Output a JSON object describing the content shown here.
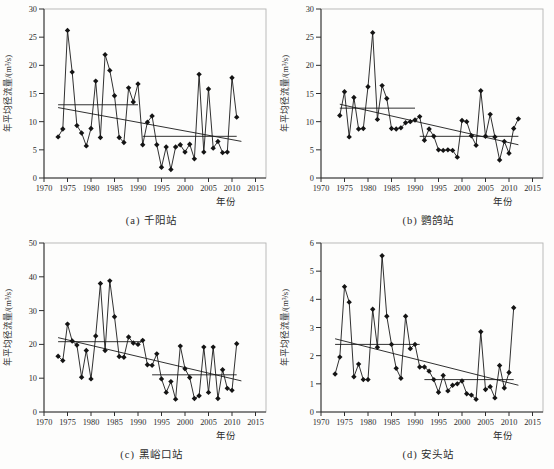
{
  "colors": {
    "line": "#1a1a1a",
    "marker": "#141414",
    "frame": "#b3b3b3",
    "axis": "#2e2e2e",
    "text": "#2b2b2b",
    "background": "#fdfdfc"
  },
  "axis_labels": {
    "y": "年平均径流量/(m³/s)",
    "x": "年份"
  },
  "chart_data": [
    {
      "id": "a",
      "type": "line",
      "station": "千阳站",
      "caption": "(a) 千阳站",
      "xlabel": "年份",
      "ylabel": "年平均径流量/(m³/s)",
      "xlim": [
        1970,
        2015
      ],
      "ylim": [
        0,
        30
      ],
      "xticks": [
        1970,
        1975,
        1980,
        1985,
        1990,
        1995,
        2000,
        2005,
        2010,
        2015
      ],
      "yticks": [
        0,
        5,
        10,
        15,
        20,
        25,
        30
      ],
      "years": [
        1973,
        1974,
        1975,
        1976,
        1977,
        1978,
        1979,
        1980,
        1981,
        1982,
        1983,
        1984,
        1985,
        1986,
        1987,
        1988,
        1989,
        1990,
        1991,
        1992,
        1993,
        1994,
        1995,
        1996,
        1997,
        1998,
        1999,
        2000,
        2001,
        2002,
        2003,
        2004,
        2005,
        2006,
        2007,
        2008,
        2009,
        2010,
        2011
      ],
      "values": [
        7.3,
        8.7,
        26.2,
        18.8,
        9.3,
        8.0,
        5.7,
        8.8,
        17.2,
        7.2,
        21.9,
        19.1,
        14.6,
        7.2,
        6.3,
        16.0,
        13.5,
        16.7,
        5.9,
        9.9,
        11.0,
        5.9,
        1.9,
        5.5,
        1.5,
        5.5,
        5.9,
        4.6,
        6.0,
        3.4,
        18.4,
        4.6,
        15.8,
        5.3,
        6.5,
        4.5,
        4.6,
        17.8,
        10.8
      ],
      "mean_lines": [
        {
          "from_year": 1973,
          "to_year": 1990,
          "value": 13.0
        },
        {
          "from_year": 1991,
          "to_year": 2011,
          "value": 7.4
        }
      ],
      "trend_line": {
        "from_year": 1973,
        "from_value": 12.5,
        "to_year": 2012,
        "to_value": 6.5
      }
    },
    {
      "id": "b",
      "type": "line",
      "station": "鹦鸽站",
      "caption": "(b) 鹦鸽站",
      "xlabel": "年份",
      "ylabel": "年平均径流量/(m³/s)",
      "xlim": [
        1970,
        2015
      ],
      "ylim": [
        0,
        30
      ],
      "xticks": [
        1970,
        1975,
        1980,
        1985,
        1990,
        1995,
        2000,
        2005,
        2010,
        2015
      ],
      "yticks": [
        0,
        5,
        10,
        15,
        20,
        25,
        30
      ],
      "years": [
        1974,
        1975,
        1976,
        1977,
        1978,
        1979,
        1980,
        1981,
        1982,
        1983,
        1984,
        1985,
        1986,
        1987,
        1988,
        1989,
        1990,
        1991,
        1992,
        1993,
        1994,
        1995,
        1996,
        1997,
        1998,
        1999,
        2000,
        2001,
        2002,
        2003,
        2004,
        2005,
        2006,
        2007,
        2008,
        2009,
        2010,
        2011,
        2012
      ],
      "values": [
        11.1,
        15.3,
        7.3,
        14.3,
        8.7,
        8.8,
        16.2,
        25.8,
        10.4,
        16.4,
        14.1,
        8.8,
        8.7,
        8.9,
        9.8,
        10.0,
        10.3,
        10.9,
        6.7,
        8.7,
        7.4,
        5.0,
        4.9,
        5.0,
        4.9,
        3.7,
        10.2,
        10.0,
        7.5,
        5.8,
        15.5,
        7.4,
        11.3,
        7.3,
        3.2,
        6.5,
        4.4,
        8.8,
        10.5
      ],
      "mean_lines": [
        {
          "from_year": 1974,
          "to_year": 1990,
          "value": 12.4
        },
        {
          "from_year": 1991,
          "to_year": 2012,
          "value": 7.4
        }
      ],
      "trend_line": {
        "from_year": 1974,
        "from_value": 13.1,
        "to_year": 2012,
        "to_value": 5.9
      }
    },
    {
      "id": "c",
      "type": "line",
      "station": "黑峪口站",
      "caption": "(c) 黑峪口站",
      "xlabel": "年份",
      "ylabel": "年平均径流量/(m³/s)",
      "xlim": [
        1970,
        2015
      ],
      "ylim": [
        0,
        50
      ],
      "xticks": [
        1970,
        1975,
        1980,
        1985,
        1990,
        1995,
        2000,
        2005,
        2010,
        2015
      ],
      "yticks": [
        0,
        10,
        20,
        30,
        40,
        50
      ],
      "years": [
        1973,
        1974,
        1975,
        1976,
        1977,
        1978,
        1979,
        1980,
        1981,
        1982,
        1983,
        1984,
        1985,
        1986,
        1987,
        1988,
        1989,
        1990,
        1991,
        1992,
        1993,
        1994,
        1995,
        1996,
        1997,
        1998,
        1999,
        2000,
        2001,
        2002,
        2003,
        2004,
        2005,
        2006,
        2007,
        2008,
        2009,
        2010,
        2011
      ],
      "values": [
        16.5,
        15.2,
        26.0,
        21.0,
        19.8,
        10.3,
        18.2,
        9.8,
        22.5,
        38.0,
        18.2,
        38.8,
        28.2,
        16.4,
        16.2,
        22.2,
        20.4,
        20.0,
        21.2,
        14.0,
        13.8,
        17.2,
        9.8,
        5.8,
        9.0,
        3.8,
        19.5,
        12.8,
        10.2,
        4.0,
        4.8,
        19.2,
        5.8,
        19.2,
        4.0,
        12.5,
        7.0,
        6.4,
        20.2
      ],
      "mean_lines": [
        {
          "from_year": 1973,
          "to_year": 1991,
          "value": 20.8
        },
        {
          "from_year": 1993,
          "to_year": 2011,
          "value": 11.0
        }
      ],
      "trend_line": {
        "from_year": 1973,
        "from_value": 22.0,
        "to_year": 2012,
        "to_value": 9.2
      }
    },
    {
      "id": "d",
      "type": "line",
      "station": "安头站",
      "caption": "(d) 安头站",
      "xlabel": "年份",
      "ylabel": "年平均径流量/(m³/s)",
      "xlim": [
        1970,
        2015
      ],
      "ylim": [
        0,
        6
      ],
      "xticks": [
        1970,
        1975,
        1980,
        1985,
        1990,
        1995,
        2000,
        2005,
        2010,
        2015
      ],
      "yticks": [
        0,
        1,
        2,
        3,
        4,
        5,
        6
      ],
      "years": [
        1973,
        1974,
        1975,
        1976,
        1977,
        1978,
        1979,
        1980,
        1981,
        1982,
        1983,
        1984,
        1985,
        1986,
        1987,
        1988,
        1989,
        1990,
        1991,
        1992,
        1993,
        1994,
        1995,
        1996,
        1997,
        1998,
        1999,
        2000,
        2001,
        2002,
        2003,
        2004,
        2005,
        2006,
        2007,
        2008,
        2009,
        2010,
        2011
      ],
      "values": [
        1.35,
        1.95,
        4.45,
        3.9,
        1.25,
        1.7,
        1.15,
        1.15,
        3.65,
        2.3,
        5.55,
        3.4,
        2.4,
        1.55,
        1.2,
        3.4,
        2.25,
        2.4,
        1.6,
        1.6,
        1.45,
        1.15,
        0.7,
        1.3,
        0.75,
        0.95,
        1.0,
        1.1,
        0.65,
        0.6,
        0.45,
        2.85,
        0.8,
        0.9,
        0.5,
        1.65,
        0.85,
        1.4,
        3.7
      ],
      "mean_lines": [
        {
          "from_year": 1973,
          "to_year": 1991,
          "value": 2.4
        },
        {
          "from_year": 1992,
          "to_year": 2011,
          "value": 1.15
        }
      ],
      "trend_line": {
        "from_year": 1973,
        "from_value": 2.6,
        "to_year": 2012,
        "to_value": 0.95
      }
    }
  ]
}
